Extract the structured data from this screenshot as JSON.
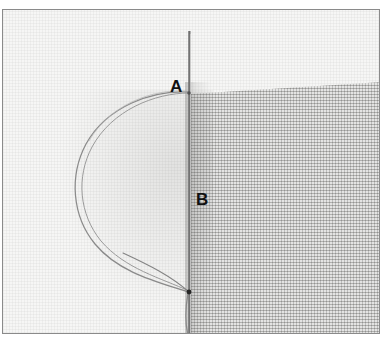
{
  "figure": {
    "kind": "sewing-stitch-illustration",
    "labels": [
      {
        "id": "A",
        "text": "A",
        "meaning": "upper needle entry point at the fabric fold edge"
      },
      {
        "id": "B",
        "text": "B",
        "meaning": "lower point on the needle shaft inside the fabric"
      }
    ],
    "elements": {
      "needle": "needle-vertical",
      "thread_loop": "thread-loop-left",
      "entry_dot": "thread-entry-point"
    },
    "colors": {
      "frame": "#8a8a8a",
      "fabric_light": "#f6f6f5",
      "fabric_dark": "#d3d3d1",
      "needle": "#6f6f6f",
      "thread": "#8c8c8c",
      "label_text": "#111111",
      "page_background": "#ffffff"
    }
  }
}
